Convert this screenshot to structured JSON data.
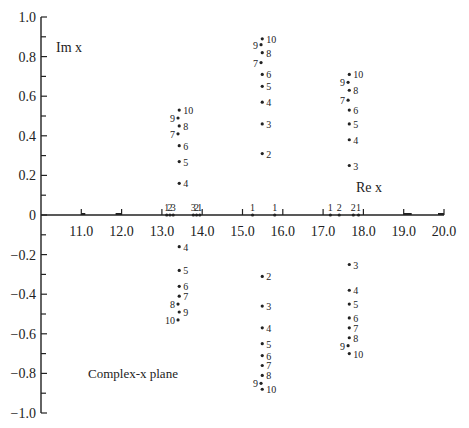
{
  "chart_data": {
    "type": "scatter",
    "title": "",
    "xlabel": "Re x",
    "ylabel": "Im x",
    "annotation": "Complex-x plane",
    "xlim": [
      10.0,
      20.0
    ],
    "ylim": [
      -1.0,
      1.0
    ],
    "x_ticks": [
      "11.0",
      "12.0",
      "13.0",
      "14.0",
      "15.0",
      "16.0",
      "17.0",
      "18.0",
      "19.0",
      "20.0"
    ],
    "y_ticks": [
      "1.0",
      "0.8",
      "0.6",
      "0.4",
      "0.2",
      "0",
      "-0.2",
      "-0.4",
      "-0.6",
      "-0.8",
      "-1.0"
    ],
    "grid": false,
    "legend": null,
    "series": [
      {
        "name": "cluster-13.4",
        "points": [
          {
            "label": "4",
            "re": 13.43,
            "im": 0.16
          },
          {
            "label": "5",
            "re": 13.43,
            "im": 0.27
          },
          {
            "label": "6",
            "re": 13.43,
            "im": 0.35
          },
          {
            "label": "7",
            "re": 13.4,
            "im": 0.41
          },
          {
            "label": "8",
            "re": 13.43,
            "im": 0.45
          },
          {
            "label": "9",
            "re": 13.4,
            "im": 0.49
          },
          {
            "label": "10",
            "re": 13.43,
            "im": 0.53
          },
          {
            "label": "4",
            "re": 13.43,
            "im": -0.16
          },
          {
            "label": "5",
            "re": 13.43,
            "im": -0.28
          },
          {
            "label": "6",
            "re": 13.43,
            "im": -0.36
          },
          {
            "label": "7",
            "re": 13.43,
            "im": -0.41
          },
          {
            "label": "8",
            "re": 13.4,
            "im": -0.45
          },
          {
            "label": "9",
            "re": 13.43,
            "im": -0.49
          },
          {
            "label": "10",
            "re": 13.4,
            "im": -0.53
          }
        ]
      },
      {
        "name": "cluster-15.5",
        "points": [
          {
            "label": "2",
            "re": 15.49,
            "im": 0.31
          },
          {
            "label": "3",
            "re": 15.49,
            "im": 0.46
          },
          {
            "label": "4",
            "re": 15.49,
            "im": 0.57
          },
          {
            "label": "5",
            "re": 15.49,
            "im": 0.65
          },
          {
            "label": "6",
            "re": 15.49,
            "im": 0.71
          },
          {
            "label": "7",
            "re": 15.46,
            "im": 0.77
          },
          {
            "label": "8",
            "re": 15.49,
            "im": 0.82
          },
          {
            "label": "9",
            "re": 15.46,
            "im": 0.86
          },
          {
            "label": "10",
            "re": 15.49,
            "im": 0.89
          },
          {
            "label": "2",
            "re": 15.49,
            "im": -0.31
          },
          {
            "label": "3",
            "re": 15.49,
            "im": -0.46
          },
          {
            "label": "4",
            "re": 15.49,
            "im": -0.57
          },
          {
            "label": "5",
            "re": 15.49,
            "im": -0.65
          },
          {
            "label": "6",
            "re": 15.49,
            "im": -0.71
          },
          {
            "label": "7",
            "re": 15.49,
            "im": -0.76
          },
          {
            "label": "8",
            "re": 15.49,
            "im": -0.81
          },
          {
            "label": "9",
            "re": 15.46,
            "im": -0.85
          },
          {
            "label": "10",
            "re": 15.49,
            "im": -0.88
          }
        ]
      },
      {
        "name": "cluster-17.6",
        "points": [
          {
            "label": "3",
            "re": 17.65,
            "im": 0.25
          },
          {
            "label": "4",
            "re": 17.65,
            "im": 0.38
          },
          {
            "label": "5",
            "re": 17.65,
            "im": 0.46
          },
          {
            "label": "6",
            "re": 17.65,
            "im": 0.53
          },
          {
            "label": "7",
            "re": 17.62,
            "im": 0.58
          },
          {
            "label": "8",
            "re": 17.65,
            "im": 0.63
          },
          {
            "label": "9",
            "re": 17.62,
            "im": 0.67
          },
          {
            "label": "10",
            "re": 17.65,
            "im": 0.71
          },
          {
            "label": "3",
            "re": 17.65,
            "im": -0.25
          },
          {
            "label": "4",
            "re": 17.65,
            "im": -0.38
          },
          {
            "label": "5",
            "re": 17.65,
            "im": -0.45
          },
          {
            "label": "6",
            "re": 17.65,
            "im": -0.52
          },
          {
            "label": "7",
            "re": 17.65,
            "im": -0.57
          },
          {
            "label": "8",
            "re": 17.65,
            "im": -0.62
          },
          {
            "label": "9",
            "re": 17.62,
            "im": -0.66
          },
          {
            "label": "10",
            "re": 17.65,
            "im": -0.7
          }
        ]
      },
      {
        "name": "real-axis",
        "points": [
          {
            "label": "1",
            "re": 13.12,
            "im": 0
          },
          {
            "label": "2",
            "re": 13.2,
            "im": 0
          },
          {
            "label": "3",
            "re": 13.28,
            "im": 0
          },
          {
            "label": "3",
            "re": 13.78,
            "im": 0
          },
          {
            "label": "2",
            "re": 13.86,
            "im": 0
          },
          {
            "label": "1",
            "re": 13.94,
            "im": 0
          },
          {
            "label": "1",
            "re": 15.25,
            "im": 0
          },
          {
            "label": "1",
            "re": 15.8,
            "im": 0
          },
          {
            "label": "1",
            "re": 17.18,
            "im": 0
          },
          {
            "label": "2",
            "re": 17.4,
            "im": 0
          },
          {
            "label": "2",
            "re": 17.75,
            "im": 0
          },
          {
            "label": "1",
            "re": 17.88,
            "im": 0
          }
        ]
      }
    ],
    "bracket_ticks": [
      10.95,
      11.95,
      13.0,
      14.0,
      15.0,
      16.0,
      17.0,
      18.0,
      19.0,
      20.0
    ]
  },
  "labels": {
    "im_axis": "Im x",
    "re_axis": "Re x",
    "plane": "Complex-x plane"
  }
}
